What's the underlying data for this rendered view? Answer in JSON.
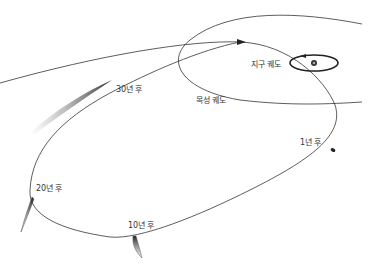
{
  "diagram": {
    "type": "comet-orbit-diagram",
    "colors": {
      "background": "#ffffff",
      "orbit_line": "#333333",
      "comet": "#444444",
      "label": "#333333"
    },
    "labels": {
      "earth_orbit": "지구 궤도",
      "jupiter_orbit": "목성 궤도",
      "after_1_year": "1년 후",
      "after_10_years": "10년 후",
      "after_20_years": "20년 후",
      "after_30_years": "30년 후"
    },
    "bodies": {
      "sun": "sun-icon",
      "comet_positions": [
        "1년 후",
        "10년 후",
        "20년 후",
        "30년 후"
      ]
    }
  }
}
